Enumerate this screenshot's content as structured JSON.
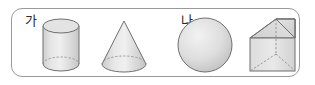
{
  "panel": {
    "border_color": "#9a9a9a",
    "background_color": "#ffffff",
    "corner_radius": "11px"
  },
  "style": {
    "outline_color": "#6f6f6f",
    "hidden_edge_color": "#8e8e8e",
    "fill_light": "#ededed",
    "fill_mid": "#d8d8d8",
    "fill_dark": "#c4c4c4",
    "label_color": "#2b2b2b"
  },
  "figure": {
    "items": [
      {
        "label": "가",
        "shape": "cylinder",
        "icon_name": "cylinder-solid-icon"
      },
      {
        "label": "나",
        "shape": "cone",
        "icon_name": "cone-solid-icon"
      },
      {
        "label": "다",
        "shape": "sphere",
        "icon_name": "sphere-solid-icon"
      },
      {
        "label": "라",
        "shape": "triangular-prism",
        "icon_name": "triangular-prism-solid-icon"
      }
    ]
  }
}
